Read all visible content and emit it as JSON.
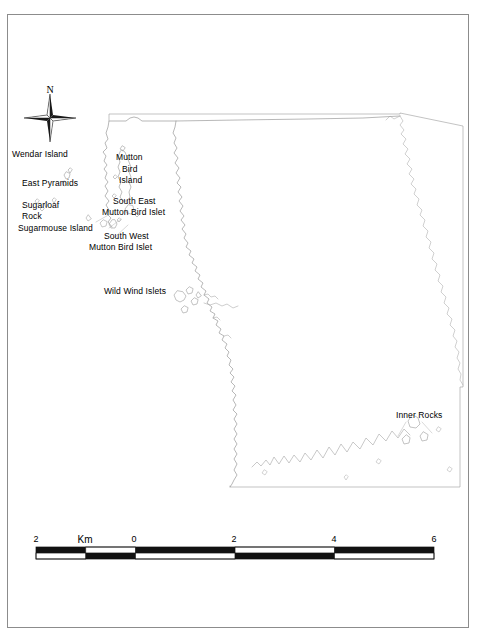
{
  "document": {
    "kind": "printed-map-figure",
    "background_color": "#ffffff",
    "frame_color": "#8c8c8c",
    "line_color": "#808080",
    "text_color": "#000000"
  },
  "north_arrow": {
    "name": "north-arrow",
    "letter": "N"
  },
  "map": {
    "labels": [
      {
        "id": "wendar-island",
        "text": "Wendar Island",
        "x": 12,
        "y": 149,
        "align": "left",
        "width": 0
      },
      {
        "id": "east-pyramids",
        "text": "East Pyramids",
        "x": 22,
        "y": 178,
        "align": "left",
        "width": 0
      },
      {
        "id": "sugarloaf-rock",
        "text": "Sugarloaf",
        "x": 22,
        "y": 200,
        "align": "left",
        "width": 0
      },
      {
        "id": "sugarloaf-rock-2",
        "text": "Rock",
        "x": 22,
        "y": 211,
        "align": "left",
        "width": 0
      },
      {
        "id": "sugarmouse-island",
        "text": "Sugarmouse Island",
        "x": 18,
        "y": 223,
        "align": "left",
        "width": 0
      },
      {
        "id": "mutton-bird-island-1",
        "text": "Mutton",
        "x": 116,
        "y": 152,
        "align": "left",
        "width": 0
      },
      {
        "id": "mutton-bird-island-2",
        "text": "Bird",
        "x": 122,
        "y": 164,
        "align": "left",
        "width": 0
      },
      {
        "id": "mutton-bird-island-3",
        "text": "Island",
        "x": 119,
        "y": 175,
        "align": "left",
        "width": 0
      },
      {
        "id": "south-east-mbi-1",
        "text": "South East",
        "x": 113,
        "y": 196,
        "align": "left",
        "width": 0
      },
      {
        "id": "south-east-mbi-2",
        "text": "Mutton Bird Islet",
        "x": 102,
        "y": 207,
        "align": "left",
        "width": 0
      },
      {
        "id": "south-west-mbi-1",
        "text": "South West",
        "x": 104,
        "y": 231,
        "align": "left",
        "width": 0
      },
      {
        "id": "south-west-mbi-2",
        "text": "Mutton Bird Islet",
        "x": 89,
        "y": 242,
        "align": "left",
        "width": 0
      },
      {
        "id": "wild-wind-islets",
        "text": "Wild Wind Islets",
        "x": 104,
        "y": 286,
        "align": "left",
        "width": 0
      },
      {
        "id": "inner-rocks",
        "text": "Inner Rocks",
        "x": 396,
        "y": 410,
        "align": "left",
        "width": 0
      }
    ]
  },
  "scalebar": {
    "name": "scale-bar",
    "unit": "Km",
    "unit_x": 85,
    "ticks": [
      {
        "label": "2",
        "x": 36
      },
      {
        "label": "0",
        "x": 134
      },
      {
        "label": "2",
        "x": 234
      },
      {
        "label": "4",
        "x": 334
      },
      {
        "label": "6",
        "x": 434
      }
    ],
    "bar_left": 36,
    "bar_right": 434,
    "segments": 8,
    "top_row_fill_first": true
  }
}
